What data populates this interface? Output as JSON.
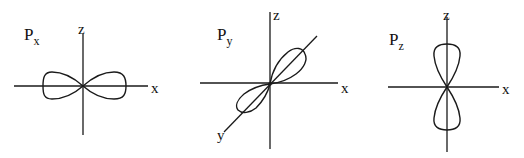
{
  "figure": {
    "panels": [
      {
        "id": "px",
        "orbital_label": "P",
        "orbital_sub": "x",
        "axis_labels": {
          "vertical": "z",
          "horizontal": "x"
        }
      },
      {
        "id": "py",
        "orbital_label": "P",
        "orbital_sub": "y",
        "axis_labels": {
          "vertical": "z",
          "horizontal": "x",
          "diagonal": "y"
        }
      },
      {
        "id": "pz",
        "orbital_label": "P",
        "orbital_sub": "z",
        "axis_labels": {
          "vertical": "z",
          "horizontal": "x"
        }
      }
    ]
  }
}
